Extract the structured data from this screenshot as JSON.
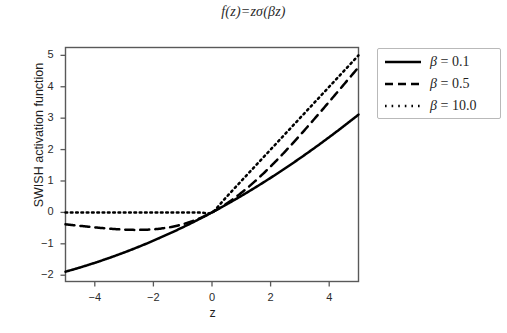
{
  "figure": {
    "title": "f(z)=zσ(βz)",
    "title_parts": {
      "f": "f",
      "open1": "(",
      "z1": "z",
      "close1": ")",
      "equals": "=",
      "z2": "z",
      "sigma": "σ",
      "open2": "(",
      "beta": "β",
      "z3": "z",
      "close2": ")"
    },
    "background_color": "#ffffff",
    "line_color": "#000000",
    "axis_color": "#595959",
    "legend_border_color": "#b9b9b9"
  },
  "axes": {
    "xlabel": "z",
    "ylabel": "SWISH activation function",
    "x_ticks": [
      "−4",
      "−2",
      "0",
      "2",
      "4"
    ],
    "x_tick_values": [
      -4,
      -2,
      0,
      2,
      4
    ],
    "y_ticks": [
      "−2",
      "−1",
      "0",
      "1",
      "2",
      "3",
      "4",
      "5"
    ],
    "y_tick_values": [
      -2,
      -1,
      0,
      1,
      2,
      3,
      4,
      5
    ],
    "xlim": [
      -5,
      5
    ],
    "ylim": [
      -2.2,
      5.25
    ],
    "grid": "off",
    "box": "on"
  },
  "legend": {
    "position": "right",
    "entries": [
      {
        "label": "β = 0.1",
        "beta": "β",
        "rest": " = 0.1",
        "style": "solid",
        "value": 0.1
      },
      {
        "label": "β = 0.5",
        "beta": "β",
        "rest": " = 0.5",
        "style": "dashed",
        "value": 0.5
      },
      {
        "label": "β = 10.0",
        "beta": "β",
        "rest": " = 10.0",
        "style": "dotted",
        "value": 10.0
      }
    ]
  },
  "chart_data": {
    "type": "line",
    "title": "f(z)=zσ(βz)",
    "xlabel": "z",
    "ylabel": "SWISH activation function",
    "xlim": [
      -5,
      5
    ],
    "ylim": [
      -2.2,
      5.25
    ],
    "grid": false,
    "legend_position": "right",
    "x": [
      -5,
      -4.5,
      -4,
      -3.5,
      -3,
      -2.5,
      -2,
      -1.5,
      -1,
      -0.5,
      0,
      0.5,
      1,
      1.5,
      2,
      2.5,
      3,
      3.5,
      4,
      4.5,
      5
    ],
    "series": [
      {
        "name": "β = 0.1",
        "beta": 0.1,
        "style": "solid",
        "color": "#000000",
        "values": [
          -1.88,
          -1.72,
          -1.57,
          -1.41,
          -1.27,
          -1.12,
          -0.98,
          -0.84,
          -0.71,
          -0.38,
          0.0,
          0.26,
          0.52,
          0.81,
          1.1,
          1.41,
          1.73,
          2.07,
          2.4,
          2.76,
          3.12
        ]
      },
      {
        "name": "β = 0.5",
        "beta": 0.5,
        "style": "dashed",
        "color": "#000000",
        "values": [
          -0.38,
          -0.43,
          -0.48,
          -0.51,
          -0.54,
          -0.55,
          -0.54,
          -0.48,
          -0.38,
          -0.22,
          0.0,
          0.28,
          0.62,
          1.02,
          1.46,
          1.95,
          2.48,
          3.03,
          3.6,
          4.19,
          4.55
        ]
      },
      {
        "name": "β = 10.0",
        "beta": 10.0,
        "style": "dotted",
        "color": "#000000",
        "values": [
          0.0,
          0.0,
          0.0,
          0.0,
          0.0,
          0.0,
          0.0,
          0.0,
          0.0,
          -0.003,
          0.0,
          0.497,
          1.0,
          1.5,
          2.0,
          2.5,
          3.0,
          3.5,
          4.0,
          4.5,
          4.88
        ]
      }
    ]
  }
}
